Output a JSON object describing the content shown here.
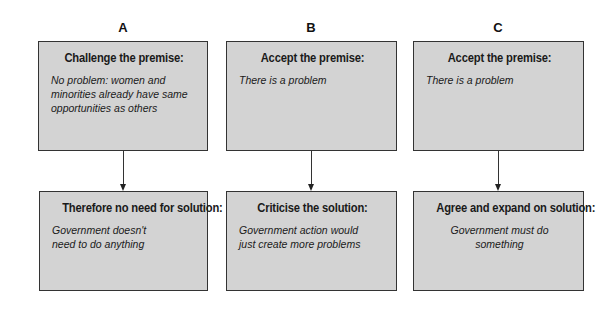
{
  "columns": [
    {
      "label": "A",
      "premise": {
        "title": "Challenge the premise:",
        "body": "No problem: women and minorities already have same opportunities as others"
      },
      "solution": {
        "title": "Therefore no need for solution:",
        "body": "Government doesn't need to do anything"
      }
    },
    {
      "label": "B",
      "premise": {
        "title": "Accept the premise:",
        "body": "There is a problem"
      },
      "solution": {
        "title": "Criticise the solution:",
        "body": "Government action would just create more problems"
      }
    },
    {
      "label": "C",
      "premise": {
        "title": "Accept the premise:",
        "body": "There is a problem"
      },
      "solution": {
        "title": "Agree and expand on solution:",
        "body": "Government must do something"
      }
    }
  ],
  "colors": {
    "box_fill": "#d3d3d3",
    "box_border": "#333333",
    "arrow": "#333333",
    "background": "#ffffff"
  }
}
